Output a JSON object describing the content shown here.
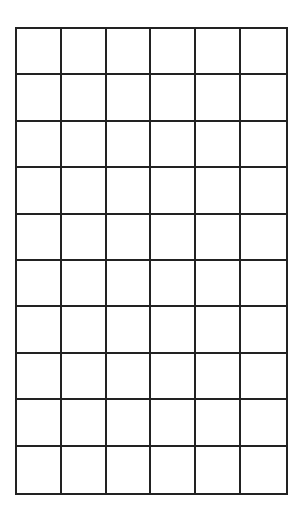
{
  "grid": {
    "rows": 10,
    "columns": 6,
    "line_color": "#222222",
    "background_color": "#ffffff",
    "cells": [
      [
        "",
        "",
        "",
        "",
        "",
        ""
      ],
      [
        "",
        "",
        "",
        "",
        "",
        ""
      ],
      [
        "",
        "",
        "",
        "",
        "",
        ""
      ],
      [
        "",
        "",
        "",
        "",
        "",
        ""
      ],
      [
        "",
        "",
        "",
        "",
        "",
        ""
      ],
      [
        "",
        "",
        "",
        "",
        "",
        ""
      ],
      [
        "",
        "",
        "",
        "",
        "",
        ""
      ],
      [
        "",
        "",
        "",
        "",
        "",
        ""
      ],
      [
        "",
        "",
        "",
        "",
        "",
        ""
      ],
      [
        "",
        "",
        "",
        "",
        "",
        ""
      ]
    ]
  }
}
